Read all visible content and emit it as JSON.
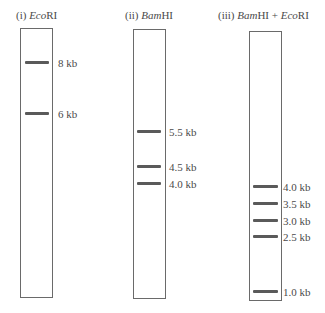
{
  "gel": {
    "lanes": [
      {
        "id": "i",
        "prefix": "(i) ",
        "enzyme_italic": "Eco",
        "enzyme_rest": "RI",
        "box": {
          "x": 20,
          "y": 28,
          "w": 33,
          "h": 270
        },
        "title_pos": {
          "x": 16,
          "y": 10
        },
        "bands": [
          {
            "label": "8 kb",
            "y": 62
          },
          {
            "label": "6 kb",
            "y": 113
          }
        ]
      },
      {
        "id": "ii",
        "prefix": "(ii) ",
        "enzyme_italic": "Bam",
        "enzyme_rest": "HI",
        "box": {
          "x": 133,
          "y": 29,
          "w": 33,
          "h": 270
        },
        "title_pos": {
          "x": 125,
          "y": 10
        },
        "bands": [
          {
            "label": "5.5 kb",
            "y": 131
          },
          {
            "label": "4.5 kb",
            "y": 166
          },
          {
            "label": "4.0 kb",
            "y": 183
          }
        ]
      },
      {
        "id": "iii",
        "prefix": "(iii) ",
        "enzyme_italic": "Bam",
        "enzyme_rest": "HI + ",
        "enzyme_italic2": "Eco",
        "enzyme_rest2": "RI",
        "box": {
          "x": 249,
          "y": 31,
          "w": 33,
          "h": 270
        },
        "title_pos": {
          "x": 218,
          "y": 10
        },
        "bands": [
          {
            "label": "4.0 kb",
            "y": 186
          },
          {
            "label": "3.5 kb",
            "y": 203
          },
          {
            "label": "3.0 kb",
            "y": 220
          },
          {
            "label": "2.5 kb",
            "y": 236
          },
          {
            "label": "1.0 kb",
            "y": 291
          }
        ]
      }
    ],
    "colors": {
      "band": "#5a5a5a",
      "border": "#6a6a6a",
      "text": "#4a4a4a"
    }
  }
}
